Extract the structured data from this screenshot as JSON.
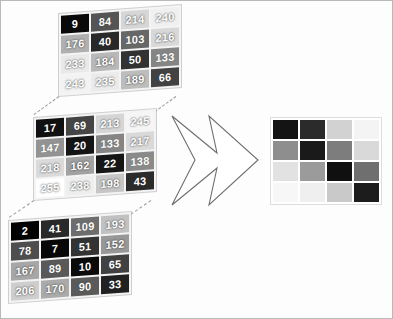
{
  "figure": {
    "border_color": "#b9b9b9",
    "background": "#fdfdfd"
  },
  "arrow": {
    "name": "double-chevron-arrow",
    "direction": "right",
    "fill": "#ffffff",
    "stroke": "#6e6e6e"
  },
  "matrices": [
    {
      "label": "channel-matrix-top",
      "rows": [
        [
          9,
          84,
          214,
          240
        ],
        [
          176,
          40,
          103,
          216
        ],
        [
          233,
          184,
          50,
          133
        ],
        [
          243,
          235,
          189,
          66
        ]
      ]
    },
    {
      "label": "channel-matrix-middle",
      "rows": [
        [
          17,
          69,
          213,
          245
        ],
        [
          147,
          20,
          133,
          217
        ],
        [
          218,
          162,
          22,
          138
        ],
        [
          255,
          238,
          198,
          43
        ]
      ]
    },
    {
      "label": "channel-matrix-bottom",
      "rows": [
        [
          2,
          41,
          109,
          193
        ],
        [
          78,
          7,
          51,
          152
        ],
        [
          167,
          89,
          10,
          65
        ],
        [
          206,
          170,
          90,
          33
        ]
      ]
    }
  ],
  "result_grid": {
    "label": "result-image-grid",
    "rows": [
      [
        "#141414",
        "#2b2b2b",
        "#d2d2d2",
        "#f4f4f4"
      ],
      [
        "#8e8e8e",
        "#1a1a1a",
        "#7d7d7d",
        "#d9d9d9"
      ],
      [
        "#e2e2e2",
        "#9b9b9b",
        "#101010",
        "#6f6f6f"
      ],
      [
        "#f7f7f7",
        "#efefef",
        "#c9c9c9",
        "#1c1c1c"
      ]
    ]
  },
  "connectors": [
    {
      "name": "dash-top-left",
      "x1": 58,
      "y1": 95,
      "x2": 33,
      "y2": 113
    },
    {
      "name": "dash-top-right",
      "x1": 175,
      "y1": 95,
      "x2": 150,
      "y2": 113
    },
    {
      "name": "dash-mid-left",
      "x1": 33,
      "y1": 199,
      "x2": 8,
      "y2": 216
    },
    {
      "name": "dash-mid-right",
      "x1": 150,
      "y1": 199,
      "x2": 125,
      "y2": 216
    }
  ]
}
